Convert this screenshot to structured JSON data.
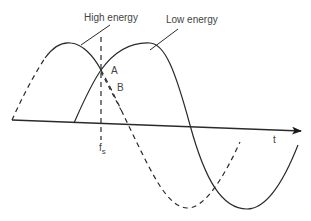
{
  "diagram": {
    "title": "",
    "labels": {
      "high_energy": "High energy",
      "low_energy": "Low energy",
      "point_a": "A",
      "point_b": "B",
      "f_main": "f",
      "f_sub": "s",
      "t_axis": "t"
    },
    "colors": {
      "line": "#2a2a2a",
      "text": "#444444",
      "background": "#ffffff"
    }
  }
}
